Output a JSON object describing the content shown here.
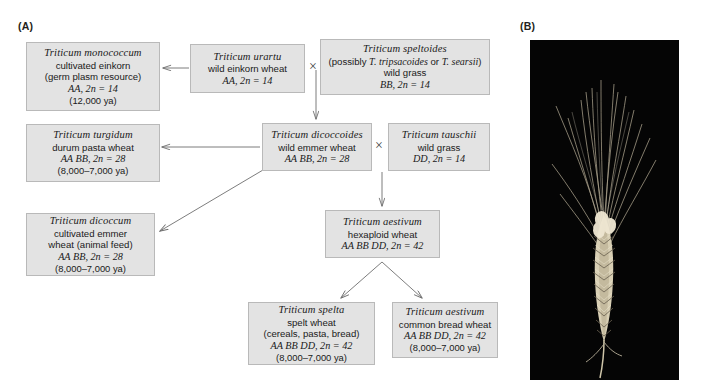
{
  "figure": {
    "panel_a_label": "(A)",
    "panel_b_label": "(B)"
  },
  "nodes": {
    "monococcum": {
      "species": "Triticum monococcum",
      "line2": "cultivated einkorn",
      "line3": "(germ plasm resource)",
      "genome": "AA, 2n = 14",
      "age": "(12,000 ya)"
    },
    "urartu": {
      "species": "Triticum urartu",
      "line2": "wild einkorn wheat",
      "genome": "AA, 2n = 14"
    },
    "speltoides": {
      "species": "Triticum speltoides",
      "line2_prefix": "(possibly ",
      "line2_sp1": "T. tripsacoides",
      "line2_mid": " or ",
      "line2_sp2": "T. searsii",
      "line2_suffix": ")",
      "line3": "wild grass",
      "genome": "BB, 2n = 14"
    },
    "turgidum": {
      "species": "Triticum turgidum",
      "line2": "durum pasta wheat",
      "genome": "AA BB, 2n = 28",
      "age": "(8,000–7,000 ya)"
    },
    "dicoccoides": {
      "species": "Triticum dicoccoides",
      "line2": "wild emmer wheat",
      "genome": "AA BB, 2n = 28"
    },
    "tauschii": {
      "species": "Triticum tauschii",
      "line2": "wild grass",
      "genome": "DD, 2n = 14"
    },
    "dicoccum": {
      "species": "Triticum dicoccum",
      "line2": "cultivated emmer",
      "line3": "wheat (animal feed)",
      "genome": "AA BB, 2n = 28",
      "age": "(8,000–7,000 ya)"
    },
    "aestivum_hexaploid": {
      "species": "Triticum aestivum",
      "line2": "hexaploid wheat",
      "genome": "AA  BB  DD, 2n = 42"
    },
    "spelta": {
      "species": "Triticum spelta",
      "line2": "spelt wheat",
      "line3": "(cereals, pasta, bread)",
      "genome": "AA BB DD, 2n = 42",
      "age": "(8,000–7,000 ya)"
    },
    "aestivum_bread": {
      "species": "Triticum aestivum",
      "line2": "common bread wheat",
      "genome": "AA BB DD, 2n = 42",
      "age": "(8,000–7,000 ya)"
    }
  },
  "crosses": {
    "cross1_symbol": "×",
    "cross2_symbol": "×"
  },
  "colors": {
    "box_fill": "#e3e3e3",
    "box_border": "#b9b9b9",
    "arrow": "#6e6e6e",
    "text": "#1a1a1a",
    "photo_background": "#050505",
    "page_background": "#ffffff"
  }
}
